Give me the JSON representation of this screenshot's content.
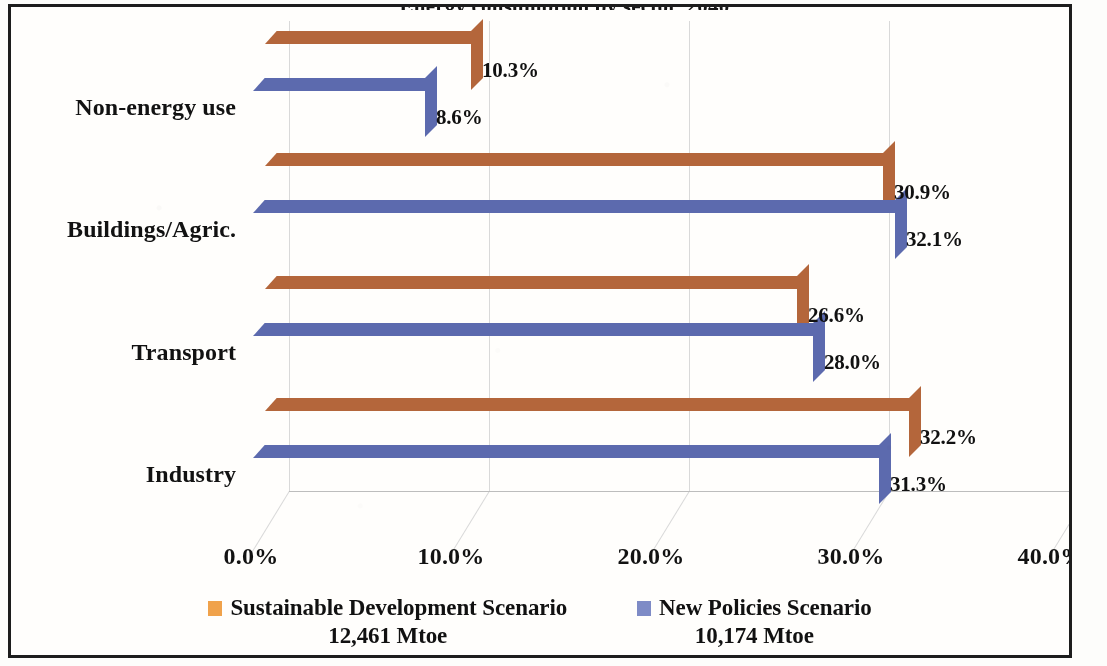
{
  "title_clipped": "Energy consumption by sector, 2040",
  "chart_data": {
    "type": "bar",
    "orientation": "horizontal",
    "title": "",
    "xlabel": "",
    "ylabel": "",
    "xlim": [
      0,
      40
    ],
    "xticks": [
      "0.0%",
      "10.0%",
      "20.0%",
      "30.0%",
      "40.0%"
    ],
    "xtick_values": [
      0,
      10,
      20,
      30,
      40
    ],
    "grid": true,
    "legend_position": "bottom",
    "categories": [
      "Non-energy use",
      "Buildings/Agric.",
      "Transport",
      "Industry"
    ],
    "series": [
      {
        "name": "Sustainable Development Scenario",
        "subtitle": "12,461 Mtoe",
        "color": "#F0A24B",
        "values": [
          10.3,
          30.9,
          26.6,
          32.2
        ],
        "labels": [
          "10.3%",
          "30.9%",
          "26.6%",
          "32.2%"
        ]
      },
      {
        "name": "New Policies Scenario",
        "subtitle": "10,174 Mtoe",
        "color": "#7E8BC6",
        "values": [
          8.6,
          32.1,
          28.0,
          31.3
        ],
        "labels": [
          "8.6%",
          "32.1%",
          "28.0%",
          "31.3%"
        ]
      }
    ]
  },
  "legend": {
    "entries": [
      {
        "label": "Sustainable Development Scenario",
        "sub": "12,461 Mtoe",
        "color": "#F0A24B"
      },
      {
        "label": "New Policies Scenario",
        "sub": "10,174 Mtoe",
        "color": "#7E8BC6"
      }
    ]
  },
  "colors": {
    "orange_front": "#F0A24B",
    "orange_top": "#B4663B",
    "orange_side": "#B4663B",
    "blue_front": "#7E8BC6",
    "blue_top": "#5C6AAE",
    "blue_side": "#5C6AAE",
    "grid": "#d9d9d9",
    "frame": "#1d1d1d",
    "text": "#121212"
  }
}
